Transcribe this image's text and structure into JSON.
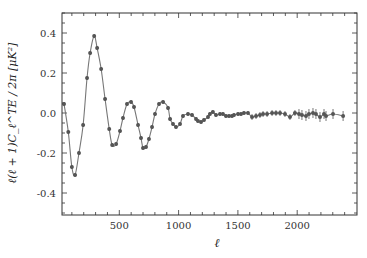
{
  "chart_data": {
    "type": "scatter",
    "title": "",
    "xlabel": "ℓ",
    "ylabel": "ℓ(ℓ + 1)C_ℓ^TE / 2π [μK²]",
    "xlim": [
      0,
      2500
    ],
    "ylim": [
      -0.51,
      0.5
    ],
    "xticks": [
      500,
      1000,
      1500,
      2000
    ],
    "yticks": [
      0.4,
      0.2,
      0.0,
      -0.2,
      -0.4
    ],
    "ytick_labels": [
      "0.4",
      "0.2",
      "0.0",
      "-0.2",
      "-0.4"
    ],
    "grid": false,
    "legend": null,
    "series": [
      {
        "name": "TE data",
        "style": "points-with-errorbars-and-fit-line",
        "color": "#555555",
        "x": [
          34,
          70,
          100,
          127,
          160,
          195,
          228,
          254,
          288,
          313,
          347,
          380,
          415,
          440,
          473,
          506,
          531,
          565,
          599,
          624,
          658,
          683,
          700,
          725,
          750,
          776,
          801,
          835,
          869,
          911,
          928,
          953,
          978,
          1012,
          1037,
          1079,
          1113,
          1147,
          1163,
          1189,
          1214,
          1248,
          1264,
          1289,
          1315,
          1349,
          1374,
          1399,
          1425,
          1450,
          1467,
          1501,
          1526,
          1551,
          1585,
          1619,
          1653,
          1686,
          1712,
          1746,
          1788,
          1821,
          1855,
          1897,
          1939,
          1981,
          2015,
          2040,
          2074,
          2099,
          2133,
          2158,
          2192,
          2226,
          2243,
          2302,
          2387
        ],
        "values": [
          0.045,
          -0.095,
          -0.27,
          -0.31,
          -0.2,
          -0.06,
          0.175,
          0.3,
          0.385,
          0.325,
          0.22,
          0.07,
          -0.08,
          -0.16,
          -0.155,
          -0.09,
          -0.025,
          0.045,
          0.055,
          0.03,
          -0.06,
          -0.125,
          -0.175,
          -0.17,
          -0.13,
          -0.07,
          -0.005,
          0.045,
          0.055,
          0.025,
          -0.03,
          -0.055,
          -0.07,
          -0.055,
          -0.015,
          -0.005,
          -0.01,
          -0.03,
          -0.04,
          -0.045,
          -0.035,
          -0.02,
          -0.005,
          0.005,
          -0.01,
          -0.005,
          -0.005,
          -0.015,
          -0.015,
          -0.015,
          -0.01,
          -0.005,
          -0.005,
          0.0,
          0.0,
          -0.02,
          -0.015,
          -0.01,
          -0.005,
          -0.005,
          0.0,
          0.0,
          0.0,
          -0.005,
          -0.02,
          0.0,
          -0.005,
          -0.01,
          -0.015,
          -0.005,
          0.0,
          -0.005,
          -0.02,
          -0.005,
          -0.015,
          -0.005,
          -0.015
        ]
      }
    ]
  }
}
